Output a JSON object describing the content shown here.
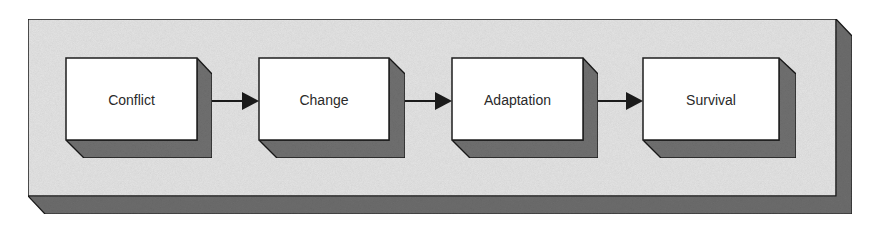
{
  "diagram": {
    "type": "flow",
    "direction": "left-to-right",
    "colors": {
      "background": "#ffffff",
      "panel_face": "#e6e6e6",
      "panel_shadow": "#6e6e6e",
      "box_face": "#ffffff",
      "box_shadow": "#727272",
      "outline": "#1e1e1e",
      "arrow": "#1a1a1a",
      "text": "#2a2a2a"
    },
    "nodes": [
      {
        "id": "conflict",
        "label": "Conflict"
      },
      {
        "id": "change",
        "label": "Change"
      },
      {
        "id": "adaptation",
        "label": "Adaptation"
      },
      {
        "id": "survival",
        "label": "Survival"
      }
    ],
    "edges": [
      {
        "from": "Conflict",
        "to": "Change"
      },
      {
        "from": "Change",
        "to": "Adaptation"
      },
      {
        "from": "Adaptation",
        "to": "Survival"
      }
    ]
  }
}
